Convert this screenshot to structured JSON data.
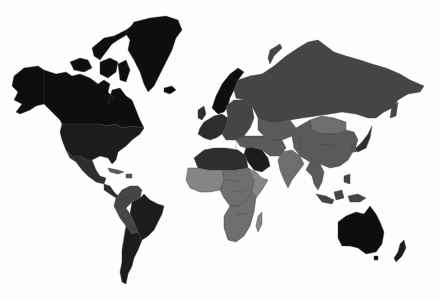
{
  "map": {
    "type": "choropleth",
    "background": "#fefefe",
    "legend": null,
    "title": null,
    "shades": {
      "darkest": "#0e0e0e",
      "very_dark": "#1c1c1c",
      "dark": "#2e2e2e",
      "mid_dark": "#454545",
      "mid": "#5a5a5a",
      "mid_light": "#6e6e6e",
      "light": "#858585"
    },
    "regions": [
      {
        "name": "Alaska",
        "shade": "darkest"
      },
      {
        "name": "Canada",
        "shade": "darkest"
      },
      {
        "name": "Canadian Arctic Islands",
        "shade": "darkest"
      },
      {
        "name": "Greenland",
        "shade": "darkest"
      },
      {
        "name": "Iceland",
        "shade": "darkest"
      },
      {
        "name": "United States",
        "shade": "very_dark"
      },
      {
        "name": "Mexico",
        "shade": "dark"
      },
      {
        "name": "Central America",
        "shade": "dark"
      },
      {
        "name": "Caribbean",
        "shade": "mid"
      },
      {
        "name": "Colombia / Venezuela",
        "shade": "mid_dark"
      },
      {
        "name": "Brazil",
        "shade": "very_dark"
      },
      {
        "name": "Peru / Bolivia",
        "shade": "mid_dark"
      },
      {
        "name": "Argentina / Chile",
        "shade": "very_dark"
      },
      {
        "name": "Scandinavia",
        "shade": "darkest"
      },
      {
        "name": "Western Europe",
        "shade": "dark"
      },
      {
        "name": "Eastern Europe",
        "shade": "mid_dark"
      },
      {
        "name": "Russia",
        "shade": "mid_dark"
      },
      {
        "name": "Central Asia",
        "shade": "mid"
      },
      {
        "name": "Mongolia",
        "shade": "mid_light"
      },
      {
        "name": "China",
        "shade": "mid"
      },
      {
        "name": "Middle East",
        "shade": "mid"
      },
      {
        "name": "Saudi Arabia",
        "shade": "very_dark"
      },
      {
        "name": "India",
        "shade": "mid_light"
      },
      {
        "name": "Southeast Asia",
        "shade": "mid"
      },
      {
        "name": "Indonesia",
        "shade": "mid_dark"
      },
      {
        "name": "Japan",
        "shade": "dark"
      },
      {
        "name": "North Africa",
        "shade": "dark"
      },
      {
        "name": "West Africa",
        "shade": "light"
      },
      {
        "name": "Central Africa",
        "shade": "mid_light"
      },
      {
        "name": "East Africa",
        "shade": "light"
      },
      {
        "name": "Southern Africa",
        "shade": "mid_light"
      },
      {
        "name": "Madagascar",
        "shade": "light"
      },
      {
        "name": "Australia",
        "shade": "darkest"
      },
      {
        "name": "New Zealand",
        "shade": "very_dark"
      }
    ]
  }
}
